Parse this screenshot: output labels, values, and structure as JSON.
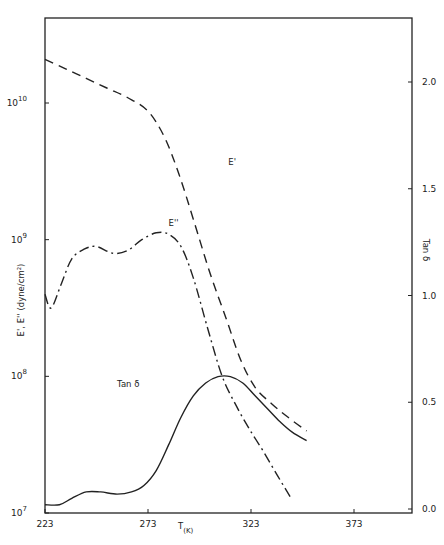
{
  "chart_data": {
    "type": "line",
    "title": "",
    "xlabel": "T(K)",
    "ylabel_left": "E', E'' (dyne/cm²)",
    "ylabel_right": "Tan δ",
    "xlim": [
      223,
      393
    ],
    "ylim_left_log10": [
      7,
      10.6
    ],
    "ylim_right": [
      0.0,
      2.35
    ],
    "x_ticks": [
      "223",
      "273",
      "323",
      "373"
    ],
    "y_left_ticks": [
      "10^7",
      "10^8",
      "10^9",
      "10^10"
    ],
    "y_right_ticks": [
      "0.0",
      "0.5",
      "1.0",
      "1.5",
      "2.0"
    ],
    "grid": false,
    "legend_position": "inline labels",
    "series": [
      {
        "name": "E'",
        "axis": "left",
        "style": "dashed",
        "x": [
          223,
          233,
          243,
          253,
          263,
          273,
          281,
          288,
          295,
          303,
          311,
          318,
          325,
          333,
          341,
          350
        ],
        "log10_y": [
          10.32,
          10.25,
          10.18,
          10.11,
          10.04,
          9.94,
          9.75,
          9.48,
          9.15,
          8.76,
          8.42,
          8.12,
          7.92,
          7.8,
          7.7,
          7.6
        ]
      },
      {
        "name": "E''",
        "axis": "left",
        "style": "dash-dot",
        "x": [
          223,
          226,
          231,
          236,
          242,
          248,
          256,
          263,
          270,
          277,
          283,
          289,
          295,
          302,
          309,
          316,
          322,
          329,
          336,
          342
        ],
        "log10_y": [
          8.6,
          8.5,
          8.68,
          8.86,
          8.93,
          8.95,
          8.9,
          8.92,
          9.0,
          9.05,
          9.04,
          8.95,
          8.72,
          8.35,
          8.0,
          7.78,
          7.62,
          7.45,
          7.27,
          7.12
        ]
      },
      {
        "name": "Tan δ",
        "axis": "right",
        "style": "solid",
        "x": [
          223,
          230,
          236,
          243,
          250,
          258,
          265,
          271,
          277,
          283,
          289,
          295,
          301,
          307,
          313,
          319,
          325,
          331,
          337,
          343,
          350
        ],
        "y": [
          0.02,
          0.02,
          0.05,
          0.08,
          0.08,
          0.07,
          0.08,
          0.11,
          0.18,
          0.3,
          0.43,
          0.53,
          0.59,
          0.62,
          0.62,
          0.59,
          0.53,
          0.47,
          0.41,
          0.36,
          0.32
        ]
      }
    ],
    "annotations": [
      {
        "text": "E'",
        "x": 312,
        "log10_y": 9.55
      },
      {
        "text": "E''",
        "x": 283,
        "log10_y": 9.1
      },
      {
        "text": "Tan δ",
        "x": 258,
        "y": 0.57
      }
    ]
  }
}
